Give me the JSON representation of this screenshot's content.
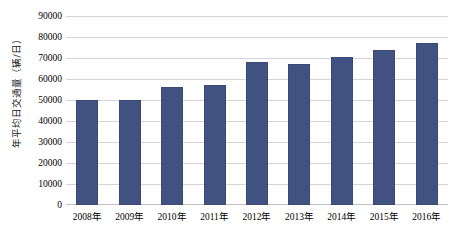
{
  "chart_data": {
    "type": "bar",
    "title": "",
    "xlabel": "",
    "ylabel": "年平均日交通量（辆/日）",
    "categories": [
      "2008年",
      "2009年",
      "2010年",
      "2011年",
      "2012年",
      "2013年",
      "2014年",
      "2015年",
      "2016年"
    ],
    "values": [
      50000,
      50000,
      56000,
      57000,
      68000,
      67000,
      70500,
      74000,
      77000
    ],
    "ylim": [
      0,
      90000
    ],
    "yticks": [
      0,
      10000,
      20000,
      30000,
      40000,
      50000,
      60000,
      70000,
      80000,
      90000
    ],
    "ytick_labels": [
      "0",
      "10000",
      "20000",
      "30000",
      "40000",
      "50000",
      "60000",
      "70000",
      "80000",
      "90000"
    ],
    "grid": true,
    "legend": null,
    "series": [
      {
        "name": "年平均日交通量",
        "color": "#415181",
        "values": [
          50000,
          50000,
          56000,
          57000,
          68000,
          67000,
          70500,
          74000,
          77000
        ]
      }
    ],
    "colors": {
      "bar": "#415181",
      "bar_border": "#3a4a78",
      "gridline": "#d4d4d4",
      "background": "#ffffff",
      "text": "#000000"
    }
  }
}
